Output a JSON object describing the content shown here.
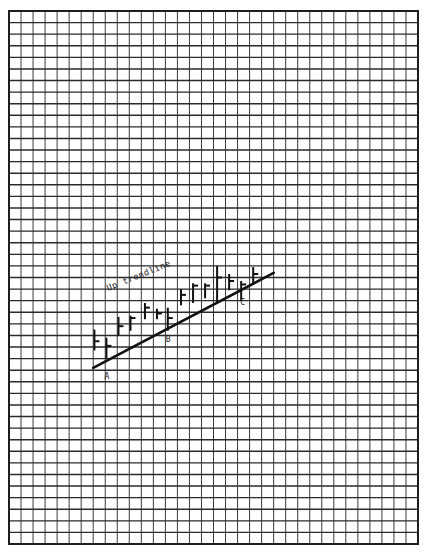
{
  "chart_data": {
    "type": "bar",
    "subtype": "ohlc-high-low-close",
    "title": "",
    "annotation": "Up trendline",
    "xlabel": "",
    "ylabel": "",
    "grid": true,
    "grid_cols": 34,
    "grid_rows": 46,
    "legend": null,
    "note": "Values are in grid units measured upward from the bottom edge of the grid; x is the grid column index.",
    "bars": [
      {
        "x": 7.1,
        "high": 18.5,
        "low": 16.7,
        "close": 17.5
      },
      {
        "x": 8.1,
        "high": 17.8,
        "low": 16.0,
        "close": 17.1
      },
      {
        "x": 9.1,
        "high": 19.6,
        "low": 18.0,
        "close": 18.8
      },
      {
        "x": 10.1,
        "high": 19.7,
        "low": 18.4,
        "close": 19.5
      },
      {
        "x": 11.3,
        "high": 20.8,
        "low": 19.4,
        "close": 20.4
      },
      {
        "x": 12.3,
        "high": 20.3,
        "low": 19.4,
        "close": 19.9
      },
      {
        "x": 13.2,
        "high": 20.4,
        "low": 18.4,
        "close": 19.5
      },
      {
        "x": 14.3,
        "high": 22.0,
        "low": 20.6,
        "close": 21.5
      },
      {
        "x": 15.3,
        "high": 22.5,
        "low": 20.8,
        "close": 22.3
      },
      {
        "x": 16.3,
        "high": 22.5,
        "low": 21.2,
        "close": 22.3
      },
      {
        "x": 17.3,
        "high": 24.0,
        "low": 20.8,
        "close": 23.0
      },
      {
        "x": 18.3,
        "high": 23.3,
        "low": 21.9,
        "close": 22.7
      },
      {
        "x": 19.3,
        "high": 22.7,
        "low": 21.0,
        "close": 22.4
      },
      {
        "x": 20.3,
        "high": 23.9,
        "low": 22.5,
        "close": 23.3
      }
    ],
    "trendline": {
      "label": "Up trendline",
      "start": {
        "x": 7.0,
        "y": 15.2
      },
      "end": {
        "x": 22.0,
        "y": 23.4
      }
    },
    "points": [
      {
        "label": "A",
        "x": 8.1,
        "y": 14.5
      },
      {
        "label": "B",
        "x": 13.2,
        "y": 17.7
      },
      {
        "label": "C",
        "x": 19.4,
        "y": 20.9
      }
    ]
  },
  "labels": {
    "trendline": "Up trendline",
    "point_a": "A",
    "point_b": "B",
    "point_c": "C"
  }
}
